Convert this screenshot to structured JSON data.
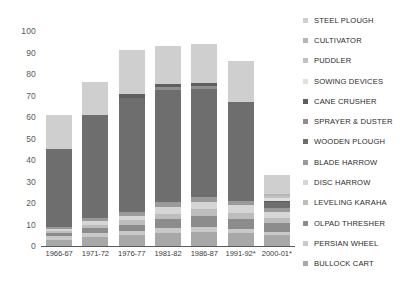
{
  "chart_data": {
    "type": "bar",
    "subtype": "stacked-bar",
    "title": "",
    "xlabel": "",
    "ylabel": "",
    "ylim": [
      0,
      100
    ],
    "ytick_values": [
      0,
      10,
      20,
      30,
      40,
      50,
      60,
      70,
      80,
      90,
      100
    ],
    "ytick_labels": [
      "0",
      "10",
      "20",
      "30",
      "40",
      "50",
      "60",
      "70",
      "80",
      "90",
      "100"
    ],
    "grid": false,
    "legend_position": "right",
    "categories": [
      "1966-67",
      "1971-72",
      "1976-77",
      "1981-82",
      "1986-87",
      "1991-92*",
      "2000-01*"
    ],
    "totals": [
      61,
      77,
      91,
      93,
      94,
      86,
      33
    ],
    "series": [
      {
        "name": "BULLOCK CART",
        "color": "#a8a8a8",
        "values": [
          3.0,
          4.0,
          5.0,
          6.0,
          6.5,
          6.0,
          5.0
        ]
      },
      {
        "name": "PERSIAN WHEEL",
        "color": "#c9c9c9",
        "values": [
          1.5,
          2.0,
          2.0,
          2.5,
          2.5,
          2.0,
          1.5
        ]
      },
      {
        "name": "OLPAD THRESHER",
        "color": "#8c8c8c",
        "values": [
          1.5,
          2.5,
          3.0,
          4.0,
          5.0,
          4.5,
          4.0
        ]
      },
      {
        "name": "LEVELING KARAHA",
        "color": "#bdbdbd",
        "values": [
          1.0,
          1.5,
          2.0,
          2.5,
          3.0,
          3.0,
          2.5
        ]
      },
      {
        "name": "DISC HARROW",
        "color": "#d6d6d6",
        "values": [
          1.0,
          1.5,
          2.0,
          3.0,
          3.5,
          3.5,
          3.0
        ]
      },
      {
        "name": "BLADE HARROW",
        "color": "#9a9a9a",
        "values": [
          1.0,
          1.5,
          2.0,
          2.5,
          2.5,
          2.0,
          1.5
        ]
      },
      {
        "name": "WOODEN PLOUGH",
        "color": "#6e6e6e",
        "values": [
          36.0,
          48.0,
          53.0,
          52.0,
          50.0,
          46.0,
          3.0
        ]
      },
      {
        "name": "SPRAYER & DUSTER",
        "color": "#8f8f8f",
        "values": [
          0.0,
          0.0,
          0.0,
          1.5,
          1.5,
          0.0,
          0.0
        ]
      },
      {
        "name": "CANE CRUSHER",
        "color": "#5f5f5f",
        "values": [
          0.0,
          0.0,
          1.5,
          1.5,
          1.5,
          0.0,
          0.5
        ]
      },
      {
        "name": "SOWING DEVICES",
        "color": "#e0e0e0",
        "values": [
          0.0,
          0.0,
          0.0,
          0.0,
          0.0,
          0.0,
          1.5
        ]
      },
      {
        "name": "PUDDLER",
        "color": "#c2c2c2",
        "values": [
          0.0,
          0.0,
          0.0,
          0.0,
          0.0,
          0.0,
          1.0
        ]
      },
      {
        "name": "CULTIVATOR",
        "color": "#b5b5b5",
        "values": [
          0.0,
          0.0,
          0.0,
          0.0,
          0.0,
          0.0,
          0.5
        ]
      },
      {
        "name": "STEEL PLOUGH",
        "color": "#cfcfcf",
        "values": [
          16.0,
          15.5,
          20.5,
          17.5,
          18.0,
          19.0,
          9.0
        ]
      }
    ]
  },
  "legend": {
    "items": [
      {
        "label": "STEEL PLOUGH",
        "color": "#cfcfcf"
      },
      {
        "label": "CULTIVATOR",
        "color": "#b5b5b5"
      },
      {
        "label": "PUDDLER",
        "color": "#c2c2c2"
      },
      {
        "label": "SOWING DEVICES",
        "color": "#e0e0e0"
      },
      {
        "label": "CANE CRUSHER",
        "color": "#5f5f5f"
      },
      {
        "label": "SPRAYER & DUSTER",
        "color": "#8f8f8f"
      },
      {
        "label": "WOODEN PLOUGH",
        "color": "#6e6e6e"
      },
      {
        "label": "BLADE HARROW",
        "color": "#9a9a9a"
      },
      {
        "label": "DISC HARROW",
        "color": "#d6d6d6"
      },
      {
        "label": "LEVELING KARAHA",
        "color": "#bdbdbd"
      },
      {
        "label": "OLPAD THRESHER",
        "color": "#8c8c8c"
      },
      {
        "label": "PERSIAN WHEEL",
        "color": "#c9c9c9"
      },
      {
        "label": "BULLOCK CART",
        "color": "#a8a8a8"
      }
    ]
  },
  "colors": {
    "axis": "#58595b",
    "tick_text": "#58595b",
    "label_text": "#3d3d3d",
    "legend_text": "#2b2b2b",
    "background": "#ffffff"
  }
}
